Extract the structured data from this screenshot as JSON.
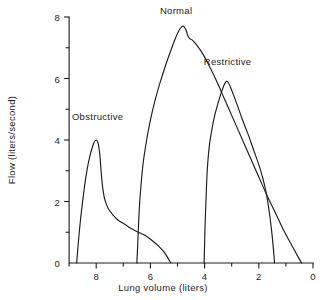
{
  "figure": {
    "background_color": "#ffffff",
    "ink_color": "#1c1c1c"
  },
  "chart_data": {
    "type": "line",
    "title": "",
    "subtitle": "",
    "xlabel": "Lung volume  (liters)",
    "ylabel": "Flow (liters/second)",
    "xlim": [
      9.0,
      0.0
    ],
    "ylim": [
      0,
      8
    ],
    "x_axis_direction": "reversed",
    "grid": false,
    "legend_position": "inline-annotations",
    "xticks": [
      8,
      6,
      4,
      2,
      0
    ],
    "xtick_labels": [
      "8",
      "6",
      "4",
      "2",
      "0"
    ],
    "x_minor_ticks": [
      9,
      7,
      5,
      3,
      1
    ],
    "yticks": [
      0,
      2,
      4,
      6,
      8
    ],
    "ytick_labels": [
      "0",
      "2",
      "4",
      "6",
      "8"
    ],
    "y_minor_ticks": [
      1,
      3,
      5,
      7
    ],
    "annotations": [
      {
        "text": "Obstructive",
        "x": 7.95,
        "y": 4.75
      },
      {
        "text": "Normal",
        "x": 5.05,
        "y": 8.2
      },
      {
        "text": "Restrictive",
        "x": 3.15,
        "y": 6.55
      }
    ],
    "series": [
      {
        "name": "Obstructive",
        "label": "Obstructive",
        "color": "#1c1c1c",
        "peak_flow": 4.0,
        "peak_volume": 8.0,
        "start_volume": 8.72,
        "end_volume": 5.25,
        "points": [
          [
            8.72,
            0.0
          ],
          [
            8.66,
            0.65
          ],
          [
            8.58,
            1.4
          ],
          [
            8.48,
            2.15
          ],
          [
            8.38,
            2.8
          ],
          [
            8.28,
            3.3
          ],
          [
            8.18,
            3.65
          ],
          [
            8.08,
            3.92
          ],
          [
            8.0,
            4.0
          ],
          [
            7.93,
            3.9
          ],
          [
            7.87,
            3.55
          ],
          [
            7.82,
            3.0
          ],
          [
            7.76,
            2.45
          ],
          [
            7.68,
            2.05
          ],
          [
            7.56,
            1.78
          ],
          [
            7.4,
            1.58
          ],
          [
            7.2,
            1.4
          ],
          [
            6.95,
            1.26
          ],
          [
            6.7,
            1.12
          ],
          [
            6.45,
            1.0
          ],
          [
            6.2,
            0.9
          ],
          [
            5.95,
            0.74
          ],
          [
            5.7,
            0.55
          ],
          [
            5.5,
            0.36
          ],
          [
            5.35,
            0.16
          ],
          [
            5.25,
            0.0
          ]
        ]
      },
      {
        "name": "Normal",
        "label": "Normal",
        "color": "#1c1c1c",
        "peak_flow": 7.7,
        "peak_volume": 4.8,
        "start_volume": 6.5,
        "end_volume": 0.42,
        "points": [
          [
            6.5,
            0.0
          ],
          [
            6.47,
            0.55
          ],
          [
            6.44,
            1.2
          ],
          [
            6.4,
            1.9
          ],
          [
            6.34,
            2.6
          ],
          [
            6.26,
            3.3
          ],
          [
            6.14,
            4.0
          ],
          [
            6.0,
            4.65
          ],
          [
            5.84,
            5.25
          ],
          [
            5.65,
            5.85
          ],
          [
            5.45,
            6.4
          ],
          [
            5.25,
            6.9
          ],
          [
            5.08,
            7.3
          ],
          [
            4.95,
            7.55
          ],
          [
            4.85,
            7.68
          ],
          [
            4.78,
            7.7
          ],
          [
            4.7,
            7.6
          ],
          [
            4.62,
            7.4
          ],
          [
            4.55,
            7.3
          ],
          [
            4.45,
            7.25
          ],
          [
            4.3,
            7.1
          ],
          [
            4.1,
            6.85
          ],
          [
            3.85,
            6.45
          ],
          [
            3.6,
            6.0
          ],
          [
            3.35,
            5.5
          ],
          [
            3.1,
            5.0
          ],
          [
            2.85,
            4.5
          ],
          [
            2.6,
            4.0
          ],
          [
            2.3,
            3.4
          ],
          [
            2.0,
            2.8
          ],
          [
            1.7,
            2.2
          ],
          [
            1.4,
            1.65
          ],
          [
            1.1,
            1.1
          ],
          [
            0.8,
            0.6
          ],
          [
            0.55,
            0.2
          ],
          [
            0.42,
            0.0
          ]
        ]
      },
      {
        "name": "Restrictive",
        "label": "Restrictive",
        "color": "#1c1c1c",
        "peak_flow": 5.9,
        "peak_volume": 3.2,
        "start_volume": 4.02,
        "end_volume": 1.42,
        "points": [
          [
            4.02,
            0.0
          ],
          [
            4.0,
            0.6
          ],
          [
            3.98,
            1.3
          ],
          [
            3.95,
            2.0
          ],
          [
            3.92,
            2.7
          ],
          [
            3.88,
            3.3
          ],
          [
            3.82,
            3.85
          ],
          [
            3.74,
            4.3
          ],
          [
            3.64,
            4.75
          ],
          [
            3.52,
            5.15
          ],
          [
            3.4,
            5.5
          ],
          [
            3.3,
            5.75
          ],
          [
            3.22,
            5.88
          ],
          [
            3.15,
            5.9
          ],
          [
            3.06,
            5.75
          ],
          [
            2.95,
            5.5
          ],
          [
            2.8,
            5.15
          ],
          [
            2.6,
            4.65
          ],
          [
            2.4,
            4.2
          ],
          [
            2.2,
            3.7
          ],
          [
            2.0,
            3.2
          ],
          [
            1.85,
            2.75
          ],
          [
            1.72,
            2.25
          ],
          [
            1.62,
            1.7
          ],
          [
            1.54,
            1.15
          ],
          [
            1.47,
            0.55
          ],
          [
            1.42,
            0.0
          ]
        ]
      }
    ]
  }
}
